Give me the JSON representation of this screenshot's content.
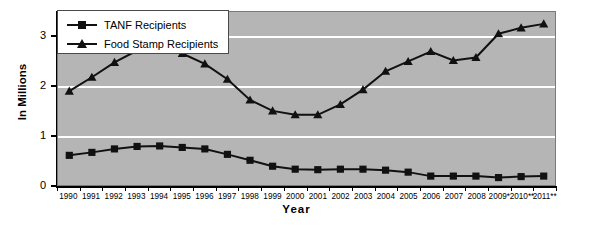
{
  "chart_data": {
    "type": "line",
    "title": "",
    "xlabel": "Year",
    "ylabel": "In Millions",
    "ylim": [
      0,
      3.5
    ],
    "yticks": [
      0,
      1,
      2,
      3
    ],
    "ytick_labels": [
      "0",
      "1",
      "2",
      "3"
    ],
    "grid": true,
    "legend_position": "top-left",
    "plot_background": "#b5b5b5",
    "gridline_color": "#ffffff",
    "series_color": "#111111",
    "categories": [
      "1990",
      "1991",
      "1992",
      "1993",
      "1994",
      "1995",
      "1996",
      "1997",
      "1998",
      "1999",
      "2000",
      "2001",
      "2002",
      "2003",
      "2004",
      "2005",
      "2006",
      "2007",
      "2008",
      "2009*",
      "2010**",
      "2011**"
    ],
    "series": [
      {
        "name": "TANF Recipients",
        "marker": "square",
        "values": [
          0.6,
          0.66,
          0.73,
          0.78,
          0.79,
          0.76,
          0.73,
          0.62,
          0.5,
          0.38,
          0.32,
          0.31,
          0.32,
          0.32,
          0.3,
          0.26,
          0.18,
          0.18,
          0.18,
          0.15,
          0.17,
          0.18
        ]
      },
      {
        "name": "Food Stamp Recipients",
        "marker": "triangle",
        "values": [
          1.9,
          2.18,
          2.48,
          2.72,
          2.8,
          2.66,
          2.45,
          2.14,
          1.72,
          1.5,
          1.42,
          1.42,
          1.63,
          1.93,
          2.3,
          2.5,
          2.7,
          2.52,
          2.58,
          3.06,
          3.18,
          3.26
        ]
      }
    ]
  },
  "legend": {
    "items": [
      {
        "label": "TANF Recipients",
        "marker": "square"
      },
      {
        "label": "Food Stamp Recipients",
        "marker": "triangle"
      }
    ]
  },
  "axes": {
    "y_title": "In Millions",
    "x_title": "Year"
  }
}
